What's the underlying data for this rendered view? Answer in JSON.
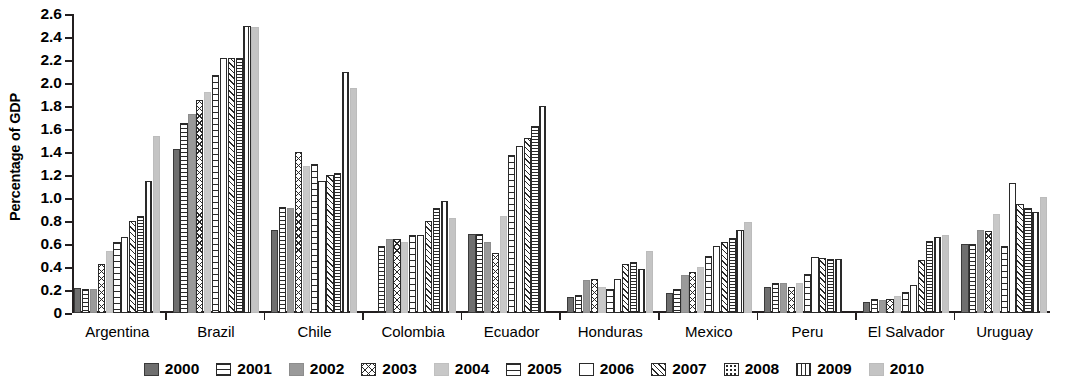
{
  "chart_data": {
    "type": "bar",
    "title": "",
    "subtitle": "",
    "xlabel": "",
    "ylabel": "Percentage of GDP",
    "ylim": [
      0,
      2.6
    ],
    "ytick_step": 0.2,
    "grid": false,
    "legend_position": "bottom",
    "yticks": [
      "2.6",
      "2.4",
      "2.2",
      "2.0",
      "1.8",
      "1.6",
      "1.4",
      "1.2",
      "1.0",
      "0.8",
      "0.6",
      "0.4",
      "0.2",
      "0"
    ],
    "categories": [
      "Argentina",
      "Brazil",
      "Chile",
      "Colombia",
      "Ecuador",
      "Honduras",
      "Mexico",
      "Peru",
      "El Salvador",
      "Uruguay"
    ],
    "legend": [
      "2000",
      "2001",
      "2002",
      "2003",
      "2004",
      "2005",
      "2006",
      "2007",
      "2008",
      "2009",
      "2010"
    ],
    "series": [
      {
        "name": "2000",
        "pattern": "p2000",
        "values": [
          0.22,
          1.43,
          0.72,
          null,
          0.69,
          0.14,
          0.17,
          0.23,
          0.1,
          0.6
        ]
      },
      {
        "name": "2001",
        "pattern": "p2001",
        "values": [
          0.21,
          1.65,
          0.92,
          0.58,
          0.69,
          0.16,
          0.21,
          0.26,
          0.12,
          0.6
        ]
      },
      {
        "name": "2002",
        "pattern": "p2002",
        "values": [
          0.21,
          1.73,
          0.91,
          0.64,
          0.62,
          0.29,
          0.33,
          0.26,
          0.11,
          0.72
        ]
      },
      {
        "name": "2003",
        "pattern": "p2003",
        "values": [
          0.43,
          1.85,
          1.4,
          0.64,
          0.52,
          0.3,
          0.36,
          0.23,
          0.12,
          0.71
        ]
      },
      {
        "name": "2004",
        "pattern": "p2004",
        "values": [
          0.54,
          1.92,
          1.28,
          0.62,
          0.84,
          0.23,
          0.4,
          0.26,
          0.15,
          0.86
        ]
      },
      {
        "name": "2005",
        "pattern": "p2005",
        "values": [
          0.62,
          2.07,
          1.3,
          0.68,
          1.37,
          0.21,
          0.5,
          0.34,
          0.18,
          0.58
        ]
      },
      {
        "name": "2006",
        "pattern": "p2006",
        "values": [
          0.66,
          2.22,
          1.15,
          0.68,
          1.45,
          0.3,
          0.58,
          0.49,
          0.24,
          1.13
        ]
      },
      {
        "name": "2007",
        "pattern": "p2007",
        "values": [
          0.8,
          2.22,
          1.2,
          0.8,
          1.52,
          0.43,
          0.62,
          0.48,
          0.46,
          0.95
        ]
      },
      {
        "name": "2008",
        "pattern": "p2008",
        "values": [
          0.84,
          2.22,
          1.22,
          0.91,
          1.63,
          0.44,
          0.65,
          0.47,
          0.63,
          0.91
        ]
      },
      {
        "name": "2009",
        "pattern": "p2009",
        "values": [
          1.15,
          2.5,
          2.1,
          0.97,
          1.8,
          0.38,
          0.72,
          0.47,
          0.66,
          0.88
        ]
      },
      {
        "name": "2010",
        "pattern": "p2010",
        "values": [
          1.54,
          2.49,
          1.96,
          0.83,
          null,
          0.54,
          0.79,
          null,
          0.68,
          1.01
        ]
      }
    ]
  }
}
